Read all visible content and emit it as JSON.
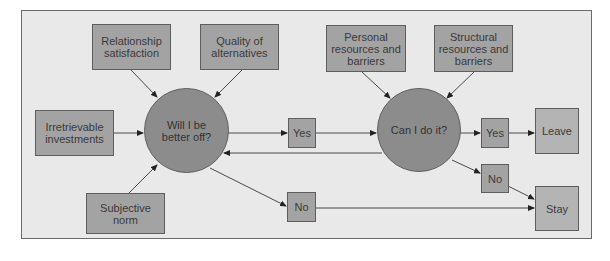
{
  "diagram": {
    "colors": {
      "background": "#e9e9e9",
      "box_fill": "#a3a3a3",
      "outcome_fill": "#b4b4b4",
      "circle_fill": "#8c8c8c",
      "line": "#4a4a4a"
    },
    "inputs_stage1": {
      "relationship_satisfaction": "Relationship\nsatisfaction",
      "quality_of_alternatives": "Quality of\nalternatives",
      "irretrievable_investments": "Irretrievable\ninvestments",
      "subjective_norm": "Subjective\nnorm"
    },
    "decision1": {
      "question": "Will I be\nbetter off?"
    },
    "decision1_answers": {
      "yes": "Yes",
      "no": "No"
    },
    "inputs_stage2": {
      "personal_resources": "Personal\nresources and\nbarriers",
      "structural_resources": "Structural\nresources and\nbarriers"
    },
    "decision2": {
      "question": "Can I do it?"
    },
    "decision2_answers": {
      "yes": "Yes",
      "no": "No"
    },
    "outcomes": {
      "leave": "Leave",
      "stay": "Stay"
    }
  }
}
